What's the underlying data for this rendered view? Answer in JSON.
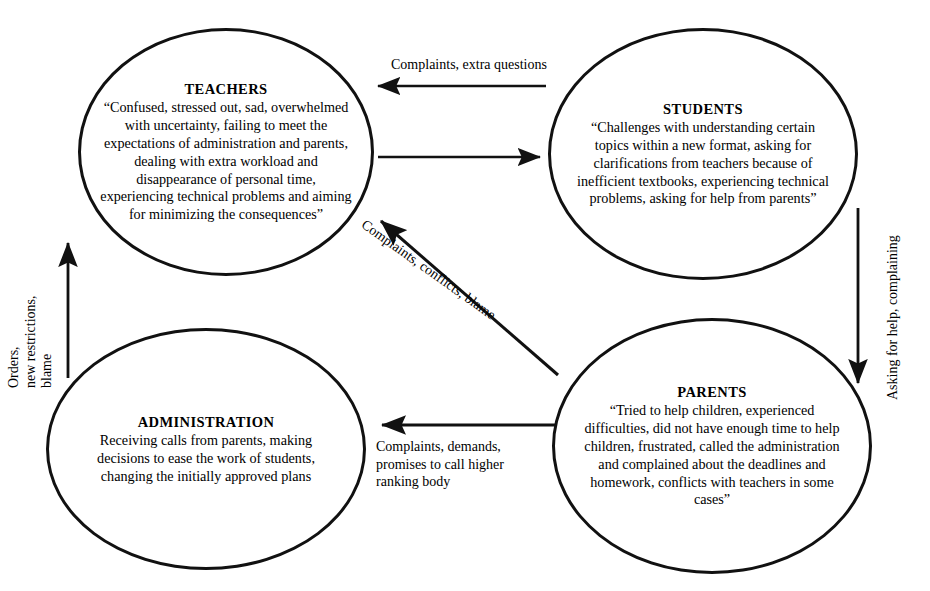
{
  "diagram": {
    "type": "cycle-influence-diagram",
    "background_color": "#ffffff",
    "stroke_color": "#111111",
    "nodes": [
      {
        "id": "teachers",
        "title": "TEACHERS",
        "body": "“Confused, stressed out, sad, overwhelmed with uncertainty, failing to meet the expectations of administration and parents, dealing with extra workload and disappearance of personal time, experiencing technical problems and aiming for minimizing the consequences”"
      },
      {
        "id": "students",
        "title": "STUDENTS",
        "body": "“Challenges with understanding certain topics within a new format, asking for clarifications from teachers because of inefficient textbooks, experiencing technical problems, asking for help from parents”"
      },
      {
        "id": "administration",
        "title": "ADMINISTRATION",
        "body": "Receiving calls from parents, making decisions to ease the work of students, changing the initially approved plans"
      },
      {
        "id": "parents",
        "title": "PARENTS",
        "body": "“Tried to help children, experienced difficulties, did not have enough time to help children, frustrated, called the administration and complained about the deadlines and homework, conflicts with teachers in some cases”"
      }
    ],
    "edges": [
      {
        "id": "students-to-teachers",
        "from": "students",
        "to": "teachers",
        "label": "Complaints, extra questions",
        "direction": "left"
      },
      {
        "id": "teachers-to-students",
        "from": "teachers",
        "to": "students",
        "label": "",
        "direction": "right"
      },
      {
        "id": "parents-to-teachers",
        "from": "parents",
        "to": "teachers",
        "label": "Complaints, conflicts, blame",
        "direction": "up-left"
      },
      {
        "id": "parents-to-administration",
        "from": "parents",
        "to": "administration",
        "label": "Complaints, demands,\npromises to call higher\nranking body",
        "direction": "left"
      },
      {
        "id": "administration-to-teachers",
        "from": "administration",
        "to": "teachers",
        "label": "Orders,\nnew restrictions,\nblame",
        "direction": "up"
      },
      {
        "id": "students-to-parents",
        "from": "students",
        "to": "parents",
        "label": "Asking for help, complaining",
        "direction": "down"
      }
    ]
  }
}
